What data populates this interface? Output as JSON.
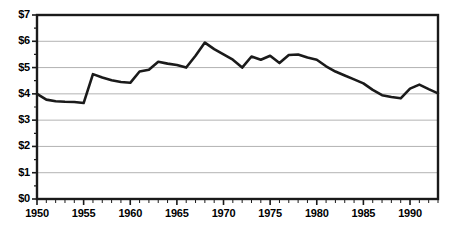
{
  "chart_data": {
    "type": "line",
    "title": "",
    "subtitle": "",
    "xlabel": "",
    "ylabel": "",
    "xlim": [
      1950,
      1993
    ],
    "ylim": [
      0,
      7
    ],
    "grid": true,
    "legend": false,
    "y_tick_format": "$%d",
    "y_ticks": [
      0,
      1,
      2,
      3,
      4,
      5,
      6,
      7
    ],
    "y_tick_labels": [
      "$0",
      "$1",
      "$2",
      "$3",
      "$4",
      "$5",
      "$6",
      "$7"
    ],
    "x_ticks": [
      1950,
      1955,
      1960,
      1965,
      1970,
      1975,
      1980,
      1985,
      1990
    ],
    "x_tick_labels": [
      "1950",
      "1955",
      "1960",
      "1965",
      "1970",
      "1975",
      "1980",
      "1985",
      "1990"
    ],
    "x_minor_tick_interval": 1,
    "line_color": "#1a1a1a",
    "line_width": 2.6,
    "grid_color": "#b3b3b3",
    "axis_color": "#1a1a1a",
    "background": "#ffffff",
    "x": [
      1950,
      1951,
      1952,
      1953,
      1954,
      1955,
      1956,
      1957,
      1958,
      1959,
      1960,
      1961,
      1962,
      1963,
      1964,
      1965,
      1966,
      1967,
      1968,
      1969,
      1970,
      1971,
      1972,
      1973,
      1974,
      1975,
      1976,
      1977,
      1978,
      1979,
      1980,
      1981,
      1982,
      1983,
      1984,
      1985,
      1986,
      1987,
      1988,
      1989,
      1990,
      1991,
      1992,
      1993
    ],
    "values": [
      4.0,
      3.78,
      3.72,
      3.7,
      3.69,
      3.65,
      4.75,
      4.62,
      4.52,
      4.45,
      4.42,
      4.85,
      4.92,
      5.22,
      5.15,
      5.1,
      5.0,
      5.45,
      5.95,
      5.7,
      5.5,
      5.3,
      5.0,
      5.42,
      5.3,
      5.45,
      5.17,
      5.48,
      5.5,
      5.38,
      5.3,
      5.05,
      4.85,
      4.7,
      4.55,
      4.4,
      4.15,
      3.95,
      3.88,
      3.83,
      4.2,
      4.35,
      4.18,
      4.02
    ]
  }
}
